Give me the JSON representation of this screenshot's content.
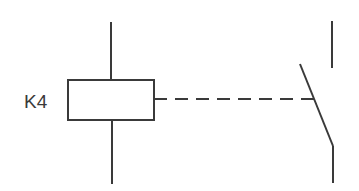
{
  "diagram": {
    "coil": {
      "label": "K4",
      "stroke": "#3a3a3a"
    },
    "mechanical_link": {
      "style": "dashed"
    },
    "contact": {
      "type": "normally-open switch"
    }
  }
}
